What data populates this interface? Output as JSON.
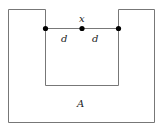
{
  "diagram": {
    "region_label": "A",
    "point_label": "x",
    "distance_labels": [
      "d",
      "d"
    ],
    "colors": {
      "line": "#777777",
      "dot": "#000000",
      "background": "#ffffff"
    }
  }
}
